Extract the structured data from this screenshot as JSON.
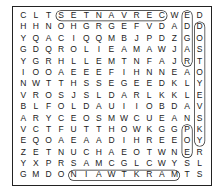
{
  "puzzle": {
    "type": "word-search",
    "rows": 15,
    "cols": 15,
    "grid": [
      "CLTSETNAVRECWED",
      "HHNOHGRGEFVDADD",
      "YQACIQQMBJPDZGO",
      "GDQROLIEAMAWJAS",
      "YGRHLLEMTNFAJRT",
      "IOOAEEEFIHNNEAO",
      "NWTTHSSEGEEDKLY",
      "VROSJSLDARLKKLE",
      "BLFOLDAUIIOBDAV",
      "ARYCEOSMWCUEANS",
      "VCTFUTTHOWKGGPK",
      "EQOAEAADIHREEOY",
      "ZETNUCHAEOTWNER",
      "YXPRSAMCGLCWYSL",
      "GMDONIAWTKRAMTS"
    ],
    "found_words": [
      {
        "word": "SETNAVREC",
        "start": [
          0,
          3
        ],
        "end": [
          0,
          11
        ]
      },
      {
        "word": "EDGAR",
        "start": [
          0,
          13
        ],
        "end": [
          4,
          13
        ]
      },
      {
        "word": "DOSTOYEVSKY",
        "start": [
          1,
          14
        ],
        "end": [
          11,
          14
        ]
      },
      {
        "word": "NIAWTKRAM",
        "start": [
          14,
          4
        ],
        "end": [
          14,
          12
        ]
      },
      {
        "word": "POE",
        "start": [
          10,
          13
        ],
        "end": [
          12,
          13
        ]
      }
    ]
  }
}
